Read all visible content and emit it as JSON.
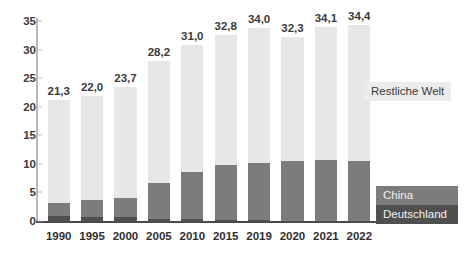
{
  "chart_data": {
    "type": "bar",
    "subtype": "stacked-bar",
    "title": "",
    "xlabel": "",
    "ylabel": "",
    "ylim": [
      0,
      35
    ],
    "ytick_step": 5,
    "yticks": [
      "0",
      "5",
      "10",
      "15",
      "20",
      "25",
      "30",
      "35"
    ],
    "grid": false,
    "legend_position": "right",
    "categories": [
      "1990",
      "1995",
      "2000",
      "2005",
      "2010",
      "2015",
      "2019",
      "2020",
      "2021",
      "2022"
    ],
    "series": [
      {
        "name": "Deutschland",
        "color": "#4f4f4f",
        "values": [
          1.0,
          0.9,
          0.8,
          0.6,
          0.5,
          0.4,
          0.3,
          0.25,
          0.2,
          0.2
        ]
      },
      {
        "name": "China",
        "color": "#7c7c7c",
        "values": [
          2.4,
          3.0,
          3.4,
          6.2,
          8.2,
          9.5,
          10.0,
          10.45,
          10.6,
          10.5
        ]
      },
      {
        "name": "Restliche Welt",
        "color": "#e7e7e7",
        "values": [
          17.9,
          18.1,
          19.5,
          21.4,
          22.3,
          22.9,
          23.7,
          21.6,
          23.3,
          23.7
        ]
      }
    ],
    "totals": [
      21.3,
      22.0,
      23.7,
      28.2,
      31.0,
      32.8,
      34.0,
      32.3,
      34.1,
      34.4
    ],
    "total_labels": [
      "21,3",
      "22,0",
      "23,7",
      "28,2",
      "31,0",
      "32,8",
      "34,0",
      "32,3",
      "34,1",
      "34,4"
    ],
    "legend_entries": [
      {
        "label": "Restliche Welt",
        "color": "#e7e7e7"
      },
      {
        "label": "China",
        "color": "#7c7c7c"
      },
      {
        "label": "Deutschland",
        "color": "#4f4f4f"
      }
    ]
  }
}
